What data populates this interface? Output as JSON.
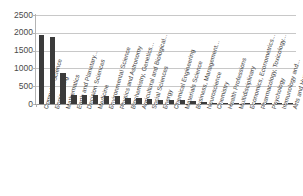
{
  "chart_data": {
    "type": "bar",
    "title": "",
    "subtitle": "",
    "xlabel": "",
    "ylabel": "",
    "ylim": [
      0,
      2500
    ],
    "yticks": [
      0,
      500,
      1000,
      1500,
      2000,
      2500
    ],
    "ytick_labels": [
      "0",
      "500",
      "1000",
      "1500",
      "2000",
      "2500"
    ],
    "grid": true,
    "legend": false,
    "legend_position": "none",
    "bar_color": "#3b3b3b",
    "gridline_color": "#c8c8c8",
    "axis_color": "#b4b4b4",
    "background_color": "#ffffff",
    "categories": [
      "Computer Science",
      "Engineering",
      "Mathematics",
      "Earth and Planetary...",
      "Decision Sciences",
      "Medicine",
      "Environmental Science",
      "Physics and Astronomy",
      "Biochemistry, Genetics...",
      "Agricultural and Biological...",
      "Social Sciences",
      "Energy",
      "Chemical Engineering",
      "Materials Science",
      "Business, Management...",
      "Neuroscience",
      "Chemistry",
      "Health Professions",
      "Multidisciplinary",
      "Economics, Econometrics...",
      "Pharmacology, Toxicology...",
      "Psychology",
      "Immunology and...",
      "Arts and Humanities"
    ],
    "values": [
      1940,
      1880,
      880,
      250,
      245,
      240,
      235,
      230,
      165,
      155,
      145,
      110,
      105,
      100,
      75,
      45,
      40,
      35,
      30,
      28,
      25,
      20,
      15,
      10
    ]
  }
}
